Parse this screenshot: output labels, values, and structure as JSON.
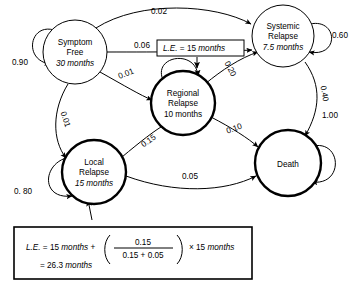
{
  "diagram": {
    "nodes": [
      {
        "id": "symptom-free",
        "name": "Symptom Free",
        "line1": "Symptom",
        "line2": "Free",
        "value": "30 months",
        "cx": 75,
        "cy": 52,
        "r": 32,
        "bold": false
      },
      {
        "id": "systemic-relapse",
        "name": "Systemic Relapse",
        "line1": "Systemic",
        "line2": "Relapse",
        "value": "7.5 months",
        "cx": 283,
        "cy": 36,
        "r": 31,
        "bold": false
      },
      {
        "id": "regional-relapse",
        "name": "Regional Relapse",
        "line1": "Regional",
        "line2": "Relapse",
        "value": "10 months",
        "cx": 183,
        "cy": 103,
        "r": 32,
        "bold": true
      },
      {
        "id": "local-relapse",
        "name": "Local Relapse",
        "line1": "Local",
        "line2": "Relapse",
        "value": "15 months",
        "cx": 94,
        "cy": 172,
        "r": 32,
        "bold": true
      },
      {
        "id": "death",
        "name": "Death",
        "line1": "Death",
        "line2": "",
        "value": "",
        "cx": 288,
        "cy": 163,
        "r": 33,
        "bold": true
      }
    ],
    "edges": [
      {
        "id": "sf-sf",
        "from": "symptom-free",
        "to": "symptom-free",
        "probability": "0.90",
        "lx": 20,
        "ly": 65,
        "rotate": 0
      },
      {
        "id": "sf-sys",
        "from": "symptom-free",
        "to": "systemic-relapse",
        "probability": "0.02",
        "lx": 159,
        "ly": 14,
        "rotate": 0
      },
      {
        "id": "sf-sys2",
        "from": "symptom-free",
        "to": "systemic-relapse",
        "probability": "0.06",
        "lx": 142,
        "ly": 48,
        "rotate": 0
      },
      {
        "id": "sf-reg",
        "from": "symptom-free",
        "to": "regional-relapse",
        "probability": "0.01",
        "lx": 127,
        "ly": 76,
        "rotate": -22
      },
      {
        "id": "sf-loc",
        "from": "symptom-free",
        "to": "local-relapse",
        "probability": "0.01",
        "lx": 63,
        "ly": 120,
        "rotate": 72
      },
      {
        "id": "sys-sys",
        "from": "systemic-relapse",
        "to": "systemic-relapse",
        "probability": "0.60",
        "lx": 340,
        "ly": 38,
        "rotate": 0
      },
      {
        "id": "sys-dth",
        "from": "systemic-relapse",
        "to": "death",
        "probability": "0.40",
        "lx": 322,
        "ly": 94,
        "rotate": 80
      },
      {
        "id": "reg-sys",
        "from": "regional-relapse",
        "to": "systemic-relapse",
        "probability": "0.20",
        "lx": 228,
        "ly": 70,
        "rotate": 62
      },
      {
        "id": "reg-dth",
        "from": "regional-relapse",
        "to": "death",
        "probability": "0.10",
        "lx": 235,
        "ly": 131,
        "rotate": -20
      },
      {
        "id": "loc-reg",
        "from": "local-relapse",
        "to": "regional-relapse",
        "probability": "0.15",
        "lx": 150,
        "ly": 143,
        "rotate": -35
      },
      {
        "id": "loc-dth",
        "from": "local-relapse",
        "to": "death",
        "probability": "0.05",
        "lx": 190,
        "ly": 179,
        "rotate": 0
      },
      {
        "id": "loc-loc",
        "from": "local-relapse",
        "to": "local-relapse",
        "probability": "0. 80",
        "lx": 23,
        "ly": 194,
        "rotate": 0
      },
      {
        "id": "dth-dth",
        "from": "death",
        "to": "death",
        "probability": "1.00",
        "lx": 330,
        "ly": 118,
        "rotate": 0
      }
    ],
    "callout": {
      "id": "le-callout",
      "text": "L.E. = 15 months",
      "le_prefix": "L.E.",
      "le_rest": " = 15 ",
      "le_units": "months"
    },
    "formula": {
      "id": "le-formula",
      "line1_a": "L.E.",
      "line1_b": " = 15 ",
      "line1_c": "months",
      "line1_d": " + ",
      "numerator": "0.15",
      "denominator": "0.15 + 0.05",
      "line1_e": "× 15 ",
      "line1_f": "months",
      "line2_a": "= 26.3 ",
      "line2_b": "months"
    }
  }
}
